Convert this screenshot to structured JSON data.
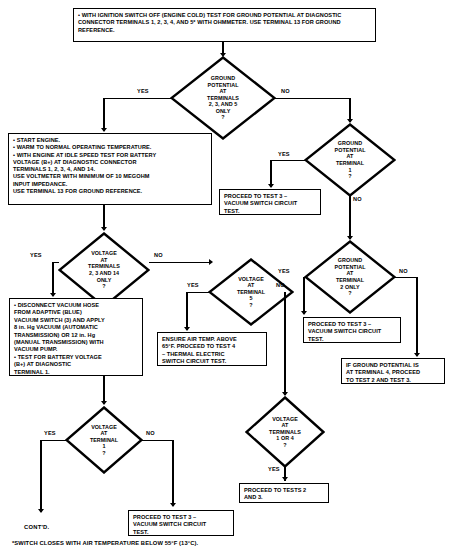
{
  "diagram": {
    "type": "flowchart",
    "footnote": "*SWITCH CLOSES WITH AIR TEMPERATURE BELOW 55°F (13°C).",
    "continuation_label": "CONT'D."
  },
  "nodes": {
    "start_ignition": {
      "kind": "process",
      "text": "• WITH IGNITION SWITCH OFF (ENGINE COLD) TEST FOR GROUND POTENTIAL AT DIAGNOSTIC CONNECTOR TERMINALS 1, 2, 3, 4, AND 5* WITH OHMMETER. USE TERMINAL 13 FOR GROUND REFERENCE."
    },
    "d_ground_235": {
      "kind": "decision",
      "text": "GROUND\nPOTENTIAL\nAT\nTERMINALS\n2, 3, AND 5\nONLY\n?"
    },
    "start_engine": {
      "kind": "process",
      "text": "• START ENGINE.\n• WARM TO NORMAL OPERATING TEMPERATURE.\n• WITH ENGINE AT IDLE SPEED TEST FOR BATTERY\nVOLTAGE (B+) AT DIAGNOSTIC CONNECTOR\nTERMINALS 1, 2, 3, 4, AND 14.\nUSE VOLTMETER WITH MINIMUM OF 10 MEGOHM\nINPUT IMPEDANCE.\nUSE TERMINAL 13 FOR GROUND REFERENCE."
    },
    "d_ground_t1": {
      "kind": "decision",
      "text": "GROUND\nPOTENTIAL\nAT\nTERMINAL\n1\n?"
    },
    "proceed_test3_a": {
      "kind": "process",
      "text": "PROCEED TO TEST 3 –\nVACUUM SWITCH CIRCUIT\nTEST."
    },
    "d_ground_t2_only": {
      "kind": "decision",
      "text": "GROUND\nPOTENTIAL\nAT\nTERMINAL\n2 ONLY\n?"
    },
    "proceed_test3_b": {
      "kind": "process",
      "text": "PROCEED TO TEST 3 –\nVACUUM SWITCH CIRCUIT\nTEST."
    },
    "ground_t4_note": {
      "kind": "process",
      "text": "IF GROUND POTENTIAL IS\nAT TERMINAL 4, PROCEED\nTO TEST 2 AND TEST 3."
    },
    "d_volt_2314": {
      "kind": "decision",
      "text": "VOLTAGE\nAT\nTERMINALS\n2, 3 AND 14\nONLY\n?"
    },
    "d_volt_t5": {
      "kind": "decision",
      "text": "VOLTAGE\nAT\nTERMINAL\n5\n?"
    },
    "disconnect_hose": {
      "kind": "process",
      "text": "• DISCONNECT VACUUM HOSE\nFROM ADAPTIVE (BLUE)\nVACUUM SWITCH (3) AND APPLY\n8 in. Hg VACUUM (AUTOMATIC\nTRANSMISSION) OR 12 in. Hg\n(MANUAL TRANSMISSION) WITH\nVACUUM PUMP.\n• TEST FOR BATTERY VOLTAGE\n(B+) AT DIAGNOSTIC\nTERMINAL 1."
    },
    "ensure_air_temp": {
      "kind": "process",
      "text": "ENSURE AIR TEMP. ABOVE\n65°F. PROCEED TO TEST 4\n–  THERMAL ELECTRIC\nSWITCH CIRCUIT TEST."
    },
    "d_volt_t1or4": {
      "kind": "decision",
      "text": "VOLTAGE\nAT\nTERMINALS\n1 OR 4\n?"
    },
    "proceed_tests_2_3": {
      "kind": "process",
      "text": "PROCEED TO TESTS 2\nAND 3."
    },
    "d_volt_t1": {
      "kind": "decision",
      "text": "VOLTAGE\nAT\nTERMINAL\n1\n?"
    },
    "proceed_test3_c": {
      "kind": "process",
      "text": "PROCEED TO TEST 3 –\nVACUUM SWITCH CIRCUIT\nTEST."
    }
  },
  "edge_labels": {
    "yes_1": "YES",
    "no_1": "NO",
    "yes_2": "YES",
    "no_2": "NO",
    "yes_3": "YES",
    "no_3": "NO",
    "yes_4": "YES",
    "no_4": "NO",
    "yes_5": "YES",
    "no_5": "NO",
    "yes_6": "YES",
    "yes_7": "YES",
    "no_7": "NO"
  }
}
